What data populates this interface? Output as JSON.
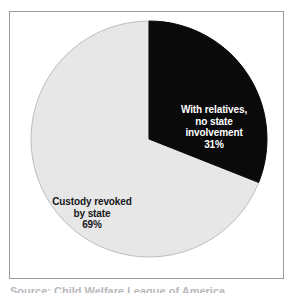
{
  "figure": {
    "panel_background": "#ffffff",
    "panel_border_color": "#9a9a9e",
    "caption_clipped": "Source: Child Welfare League of America"
  },
  "chart_data": {
    "type": "pie",
    "title": "",
    "subtitle": "",
    "xlabel": "",
    "ylabel": "",
    "grid": false,
    "legend_position": "none",
    "labels_inside_slices": true,
    "start_angle_deg": 0,
    "direction": "clockwise",
    "center": {
      "x": 139,
      "y": 127
    },
    "radius": 118,
    "categories": [
      "With relatives, no state involvement",
      "Custody revoked by state"
    ],
    "values": [
      31,
      69
    ],
    "value_unit": "%",
    "colors": [
      "#0a0a0a",
      "#e7e7e7"
    ],
    "slices": [
      {
        "name": "With relatives, no state involvement",
        "value": 31,
        "value_text": "31%",
        "color": "#0a0a0a",
        "label_color": "#ffffff",
        "label_lines": [
          "With relatives,",
          "no state",
          "involvement"
        ]
      },
      {
        "name": "Custody revoked by state",
        "value": 69,
        "value_text": "69%",
        "color": "#e7e7e7",
        "label_color": "#17171a",
        "label_lines": [
          "Custody revoked",
          "by state"
        ]
      }
    ]
  },
  "labels": {
    "black_slice": {
      "line1": "With relatives,",
      "line2": "no state",
      "line3": "involvement",
      "percent": "31%"
    },
    "gray_slice": {
      "line1": "Custody revoked",
      "line2": "by state",
      "percent": "69%"
    }
  }
}
